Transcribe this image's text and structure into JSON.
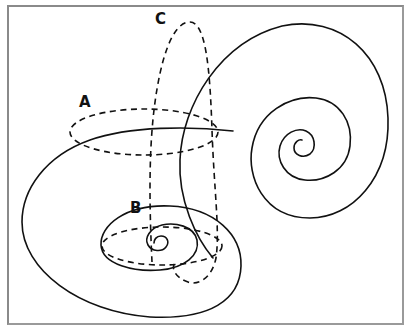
{
  "figure": {
    "labels": {
      "a": "A",
      "b": "B",
      "c": "C"
    },
    "colors": {
      "line": "#111111",
      "frame": "#8a8a8a",
      "background": "#ffffff"
    }
  }
}
